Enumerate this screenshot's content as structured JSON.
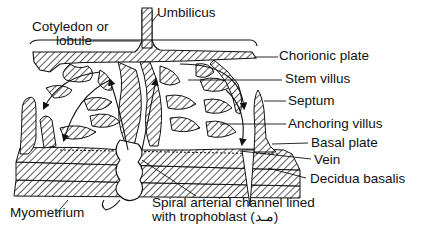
{
  "diagram": {
    "labels": {
      "cotyledon_line1": "Cotyledon or",
      "cotyledon_line2": "lobule",
      "umbilicus": "Umbilicus",
      "chorionic_plate": "Chorionic plate",
      "stem_villus": "Stem villus",
      "septum": "Septum",
      "anchoring_villus": "Anchoring villus",
      "basal_plate": "Basal plate",
      "vein": "Vein",
      "decidua_basalis": "Decidua basalis",
      "myometrium": "Myometrium",
      "spiral_line1": "Spiral arterial channel lined",
      "spiral_line2": "with trophoblast (مـد)"
    },
    "colors": {
      "ink": "#111111",
      "background": "#ffffff"
    }
  }
}
